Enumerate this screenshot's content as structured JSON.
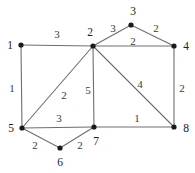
{
  "figure": {
    "kind": "weighted-undirected-graph",
    "background_color": "#ffffff",
    "edge_color": "#6e6e6e",
    "node_color": "#1a1a1a",
    "label_color": "#2b2b2b",
    "width": 195,
    "height": 173
  },
  "graph_data": {
    "type": "node-link-diagram",
    "directed": false,
    "weighted": true,
    "node_count": 8,
    "edge_count": 13,
    "nodes": [
      {
        "id": "1",
        "label": "1",
        "x": 21,
        "y": 45,
        "label_x": 10,
        "label_y": 45
      },
      {
        "id": "2",
        "label": "2",
        "x": 93,
        "y": 46,
        "label_x": 90,
        "label_y": 32
      },
      {
        "id": "3",
        "label": "3",
        "x": 131,
        "y": 25,
        "label_x": 133,
        "label_y": 11
      },
      {
        "id": "4",
        "label": "4",
        "x": 174,
        "y": 46,
        "label_x": 186,
        "label_y": 46
      },
      {
        "id": "5",
        "label": "5",
        "x": 22,
        "y": 128,
        "label_x": 11,
        "label_y": 128
      },
      {
        "id": "6",
        "label": "6",
        "x": 60,
        "y": 148,
        "label_x": 60,
        "label_y": 162
      },
      {
        "id": "7",
        "label": "7",
        "x": 94,
        "y": 127,
        "label_x": 96,
        "label_y": 141
      },
      {
        "id": "8",
        "label": "8",
        "x": 174,
        "y": 127,
        "label_x": 186,
        "label_y": 128
      }
    ],
    "edges": [
      {
        "source": "1",
        "target": "2",
        "weight": "3",
        "label_x": 57,
        "label_y": 34
      },
      {
        "source": "2",
        "target": "3",
        "weight": "3",
        "label_x": 113,
        "label_y": 28
      },
      {
        "source": "3",
        "target": "4",
        "weight": "2",
        "label_x": 156,
        "label_y": 28
      },
      {
        "source": "2",
        "target": "4",
        "weight": "2",
        "label_x": 133,
        "label_y": 41
      },
      {
        "source": "1",
        "target": "5",
        "weight": "1",
        "label_x": 12,
        "label_y": 88
      },
      {
        "source": "5",
        "target": "2",
        "weight": "2",
        "label_x": 64,
        "label_y": 95
      },
      {
        "source": "2",
        "target": "7",
        "weight": "5",
        "label_x": 88,
        "label_y": 90
      },
      {
        "source": "2",
        "target": "8",
        "weight": "4",
        "label_x": 140,
        "label_y": 84
      },
      {
        "source": "4",
        "target": "8",
        "weight": "2",
        "label_x": 182,
        "label_y": 88
      },
      {
        "source": "5",
        "target": "7",
        "weight": "3",
        "label_x": 59,
        "label_y": 118
      },
      {
        "source": "5",
        "target": "6",
        "weight": "2",
        "label_x": 35,
        "label_y": 145
      },
      {
        "source": "6",
        "target": "7",
        "weight": "2",
        "label_x": 80,
        "label_y": 145
      },
      {
        "source": "7",
        "target": "8",
        "weight": "1",
        "label_x": 137,
        "label_y": 118
      }
    ]
  }
}
